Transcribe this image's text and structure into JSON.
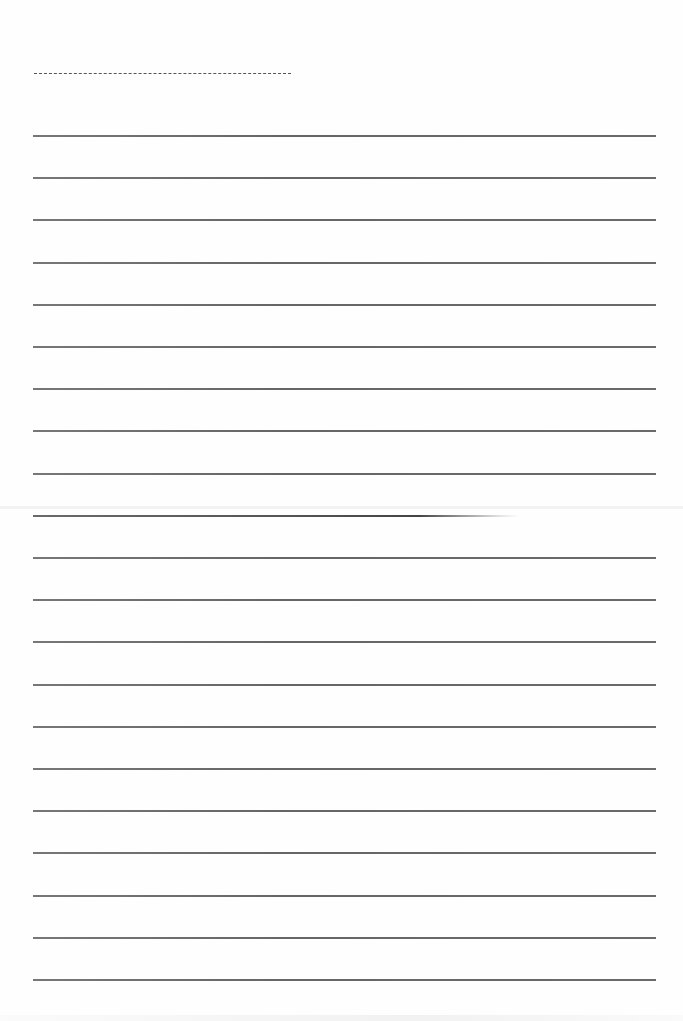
{
  "document": {
    "type": "lined-paper",
    "name_line": {
      "style": "dashed",
      "color": "#555555",
      "x_start": 34,
      "x_end": 291,
      "y": 73
    },
    "rules": {
      "count": 21,
      "color": "#6a6a6a",
      "x_start": 33,
      "x_end": 656,
      "first_y": 135,
      "spacing": 42.2,
      "faded_index": 9
    },
    "background_color": "#fefefe",
    "text_content": []
  }
}
